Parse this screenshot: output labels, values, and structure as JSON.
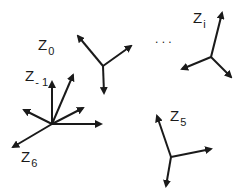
{
  "diagram": {
    "type": "coordinate-frames",
    "colors": {
      "ink": "#1a1a1a",
      "background": "#ffffff"
    },
    "frames": [
      {
        "id": "z0",
        "label": "Z",
        "subscript": "0",
        "label_pos": [
          38,
          50
        ],
        "origin": [
          103,
          66
        ],
        "axes": [
          [
            78,
            36
          ],
          [
            131,
            46
          ],
          [
            104,
            93
          ]
        ]
      },
      {
        "id": "zi",
        "label": "Z",
        "subscript": "i",
        "label_pos": [
          193,
          23
        ],
        "origin": [
          211,
          57
        ],
        "axes": [
          [
            222,
            13
          ],
          [
            182,
            69
          ],
          [
            231,
            77
          ]
        ]
      },
      {
        "id": "zm1",
        "label": "Z",
        "subscript": "- 1",
        "label_pos": [
          25,
          81
        ],
        "origin": [
          52,
          124
        ],
        "axes": [
          [
            52,
            82
          ],
          [
            73,
            75
          ],
          [
            83,
            108
          ],
          [
            101,
            124
          ],
          [
            24,
            110
          ]
        ]
      },
      {
        "id": "z6",
        "label": "Z",
        "subscript": "6",
        "label_pos": [
          21,
          162
        ],
        "origin": [
          52,
          124
        ],
        "axes": [
          [
            13,
            147
          ]
        ]
      },
      {
        "id": "z5",
        "label": "Z",
        "subscript": "5",
        "label_pos": [
          170,
          121
        ],
        "origin": [
          171,
          157
        ],
        "axes": [
          [
            157,
            116
          ],
          [
            211,
            149
          ],
          [
            166,
            186
          ]
        ]
      }
    ],
    "ellipsis": {
      "text": ". . .",
      "pos": [
        155,
        43
      ]
    }
  }
}
